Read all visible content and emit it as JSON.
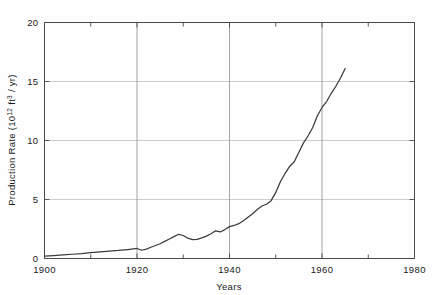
{
  "chart_data": {
    "type": "line",
    "title": "",
    "xlabel": "Years",
    "ylabel": "Production Rate (10¹² ft³ / yr)",
    "ylabel_parts": {
      "prefix": "Production Rate (10",
      "exp1": "12",
      "mid": " ft",
      "exp2": "3",
      "suffix": " / yr)"
    },
    "xlim": [
      1900,
      1980
    ],
    "ylim": [
      0,
      20
    ],
    "xticks": [
      1900,
      1920,
      1940,
      1960,
      1980
    ],
    "xtick_labels": [
      "1900",
      "1920",
      "1940",
      "1960",
      "1980"
    ],
    "xminor_ticks": [
      1910,
      1930,
      1950,
      1970
    ],
    "yticks": [
      0,
      5,
      10,
      15,
      20
    ],
    "ytick_labels": [
      "0",
      "5",
      "10",
      "15",
      "20"
    ],
    "grid": "major-x-and-y",
    "legend": "none",
    "series": [
      {
        "name": "U.S. Natural Gas Production Rate",
        "x": [
          1900,
          1902,
          1904,
          1906,
          1908,
          1910,
          1912,
          1914,
          1916,
          1918,
          1920,
          1921,
          1922,
          1923,
          1924,
          1925,
          1926,
          1927,
          1928,
          1929,
          1930,
          1931,
          1932,
          1933,
          1934,
          1935,
          1936,
          1937,
          1938,
          1939,
          1940,
          1941,
          1942,
          1943,
          1944,
          1945,
          1946,
          1947,
          1948,
          1949,
          1950,
          1951,
          1952,
          1953,
          1954,
          1955,
          1956,
          1957,
          1958,
          1959,
          1960,
          1961,
          1962,
          1963,
          1964,
          1965
        ],
        "y": [
          0.2,
          0.25,
          0.3,
          0.36,
          0.42,
          0.5,
          0.56,
          0.62,
          0.68,
          0.76,
          0.85,
          0.7,
          0.8,
          0.95,
          1.1,
          1.25,
          1.45,
          1.65,
          1.85,
          2.05,
          1.95,
          1.72,
          1.6,
          1.62,
          1.75,
          1.9,
          2.1,
          2.35,
          2.25,
          2.45,
          2.7,
          2.8,
          2.95,
          3.2,
          3.5,
          3.8,
          4.15,
          4.45,
          4.6,
          4.9,
          5.6,
          6.5,
          7.2,
          7.8,
          8.2,
          9.0,
          9.8,
          10.4,
          11.1,
          12.1,
          12.8,
          13.3,
          14.0,
          14.6,
          15.3,
          16.1
        ]
      }
    ]
  },
  "annotations": {
    "data_end_year": "1965",
    "data_end_value": "16.1",
    "data_start_year": "1900",
    "data_start_value": "0.2"
  },
  "colors": {
    "line": "#3b3b3b",
    "grid": "#b9b9b9",
    "axis": "#4a4a4a",
    "background": "#fefefe",
    "text": "#1a1a1a"
  }
}
